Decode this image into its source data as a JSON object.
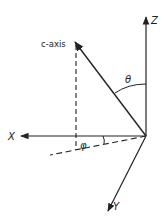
{
  "diagram": {
    "title": "",
    "axes": {
      "z": {
        "label": "Z"
      },
      "x": {
        "label": "X"
      },
      "y": {
        "label": "Y"
      }
    },
    "vector": {
      "label": "c-axis"
    },
    "angles": {
      "polar": {
        "label": "θ"
      },
      "azimuthal": {
        "label": "φ"
      }
    },
    "colors": {
      "ink": "#222222",
      "background": "#ffffff"
    }
  }
}
